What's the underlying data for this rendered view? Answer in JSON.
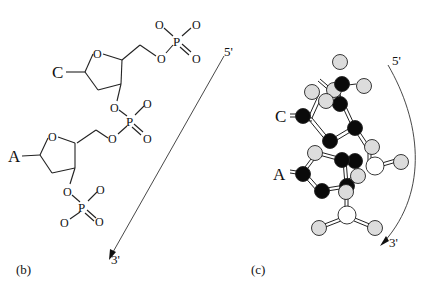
{
  "panel_b": {
    "label": "(b)",
    "nucleotides": [
      {
        "base": "C",
        "ring_oxygen": "O",
        "phosphate": {
          "p": "P",
          "o1": "O",
          "o2": "O",
          "o3": "O",
          "o4": "O"
        }
      },
      {
        "base": "A",
        "ring_oxygen": "O",
        "phosphate": {
          "p": "P",
          "o1": "O",
          "o2": "O",
          "o3": "O",
          "o4": "O"
        }
      }
    ],
    "bridge_phosphate": {
      "p": "P",
      "o1": "O",
      "o2": "O",
      "o3": "O",
      "o4": "O"
    },
    "direction": {
      "start": "5'",
      "end": "3'"
    }
  },
  "panel_c": {
    "label": "(c)",
    "bases": [
      "C",
      "A"
    ],
    "direction": {
      "start": "5'",
      "end": "3'"
    },
    "colors": {
      "dark_atom": "#0a0a0a",
      "light_atom": "#d8d8d8",
      "white_atom": "#ffffff",
      "stroke": "#222222"
    }
  }
}
